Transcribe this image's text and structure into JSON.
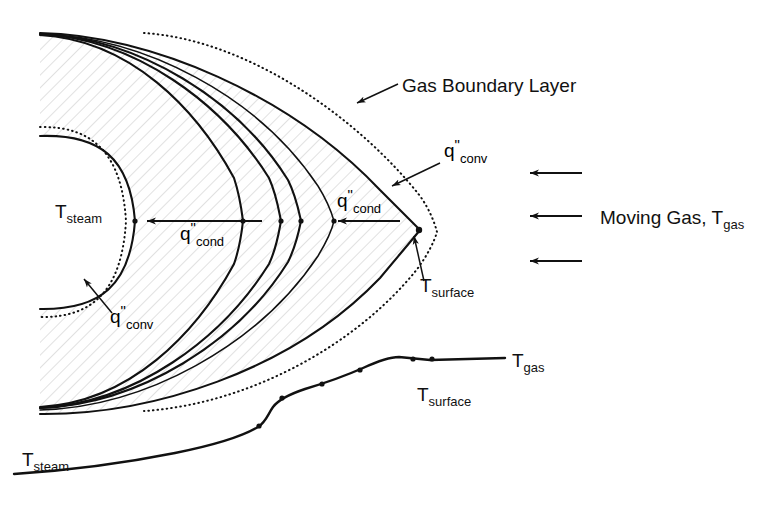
{
  "figure": {
    "domain": "diagram",
    "background_color": "#ffffff",
    "ink_color": "#111111"
  },
  "labels": {
    "gas_boundary_layer": "Gas Boundary Layer",
    "moving_gas": "Moving Gas, T",
    "moving_gas_sub": "gas",
    "t_steam": "T",
    "t_steam_sub": "steam",
    "t_surface": "T",
    "t_surface_sub": "surface",
    "t_gas": "T",
    "t_gas_sub": "gas",
    "q_symbol": "q",
    "q_prime_prime": "\"",
    "q_cond_sub": "cond",
    "q_conv_sub": "conv"
  },
  "annotations": [
    {
      "id": "gas-boundary-layer",
      "text": "Gas Boundary Layer",
      "x": 400,
      "y": 90,
      "leader_from": [
        396,
        84
      ],
      "leader_to": [
        355,
        104
      ]
    },
    {
      "id": "q-conv-outer",
      "text": "q\"conv",
      "x": 446,
      "y": 156,
      "leader_from": [
        442,
        162
      ],
      "leader_to": [
        390,
        186
      ]
    },
    {
      "id": "q-cond-outer",
      "text": "q\"cond",
      "x": 340,
      "y": 207,
      "arrow_from": [
        400,
        221
      ],
      "arrow_to": [
        336,
        221
      ]
    },
    {
      "id": "q-cond-inner",
      "text": "q\"cond",
      "x": 182,
      "y": 240,
      "arrow_from": [
        262,
        221
      ],
      "arrow_to": [
        145,
        221
      ]
    },
    {
      "id": "q-conv-inner",
      "text": "q\"conv",
      "x": 112,
      "y": 322,
      "leader_from": [
        110,
        314
      ],
      "leader_to": [
        82,
        277
      ]
    },
    {
      "id": "t-surface-callout",
      "text": "Tsurface",
      "x": 424,
      "y": 289,
      "leader_from": [
        424,
        281
      ],
      "leader_to": [
        412,
        234
      ]
    },
    {
      "id": "t-steam-region",
      "text": "Tsteam",
      "x": 74,
      "y": 218
    },
    {
      "id": "t-gas-profile",
      "text": "Tgas",
      "x": 512,
      "y": 366
    },
    {
      "id": "t-surface-profile",
      "text": "Tsurface",
      "x": 419,
      "y": 401
    },
    {
      "id": "t-steam-profile",
      "text": "Tsteam",
      "x": 22,
      "y": 466
    }
  ],
  "gas_arrows": [
    {
      "id": "gas-arrow-top",
      "x_start": 582,
      "x_end": 528,
      "y": 173
    },
    {
      "id": "gas-arrow-middle",
      "x_start": 582,
      "x_end": 528,
      "y": 216
    },
    {
      "id": "gas-arrow-bottom",
      "x_start": 582,
      "x_end": 528,
      "y": 261
    }
  ],
  "moving_gas_label": {
    "x": 600,
    "y": 223
  },
  "isotherm_curves": [
    {
      "id": "isotherm-1",
      "vertex_x": 135,
      "vertex_y": 221,
      "top_x": 40,
      "bottom_x": 40,
      "label": "deposit-inner-surface"
    },
    {
      "id": "isotherm-2",
      "vertex_x": 243,
      "vertex_y": 221,
      "top_x": 40,
      "bottom_x": 40,
      "label": "isotherm"
    },
    {
      "id": "isotherm-3",
      "vertex_x": 281,
      "vertex_y": 221,
      "top_x": 40,
      "bottom_x": 40,
      "label": "isotherm"
    },
    {
      "id": "isotherm-4",
      "vertex_x": 301,
      "vertex_y": 221,
      "top_x": 40,
      "bottom_x": 40,
      "label": "isotherm"
    },
    {
      "id": "isotherm-5",
      "vertex_x": 334,
      "vertex_y": 221,
      "top_x": 40,
      "bottom_x": 40,
      "label": "isotherm"
    },
    {
      "id": "isotherm-6",
      "vertex_x": 420,
      "vertex_y": 230,
      "top_x": 40,
      "bottom_x": 40,
      "label": "deposit-outer-surface"
    }
  ],
  "dotted_curves": [
    {
      "id": "boundary-layer-outer",
      "vertex_x": 437,
      "vertex_y": 232
    },
    {
      "id": "boundary-layer-inner",
      "vertex_x": 126,
      "vertex_y": 221
    }
  ],
  "temperature_profile": {
    "id": "temperature-profile-curve",
    "description": "Temperature rises from T_steam through deposit to T_surface then flat at T_gas",
    "points": [
      [
        14,
        474
      ],
      [
        60,
        470
      ],
      [
        110,
        464
      ],
      [
        160,
        456
      ],
      [
        210,
        444
      ],
      [
        245,
        432
      ],
      [
        262,
        424
      ],
      [
        272,
        409
      ],
      [
        283,
        398
      ],
      [
        303,
        390
      ],
      [
        325,
        382
      ],
      [
        345,
        374
      ],
      [
        362,
        368
      ],
      [
        378,
        361
      ],
      [
        395,
        357
      ],
      [
        412,
        361
      ],
      [
        430,
        361
      ],
      [
        448,
        360
      ],
      [
        476,
        359
      ],
      [
        505,
        358
      ]
    ],
    "marker_points": [
      [
        262,
        424
      ],
      [
        283,
        398
      ],
      [
        325,
        382
      ],
      [
        362,
        368
      ],
      [
        412,
        361
      ],
      [
        430,
        361
      ]
    ]
  },
  "hatched_region": {
    "id": "deposit-hatching",
    "description": "Diagonal hatch fill representing the deposit layer between inner and outer surfaces",
    "hatch_color": "#cfcfcf",
    "hatch_angle_deg": 45
  }
}
